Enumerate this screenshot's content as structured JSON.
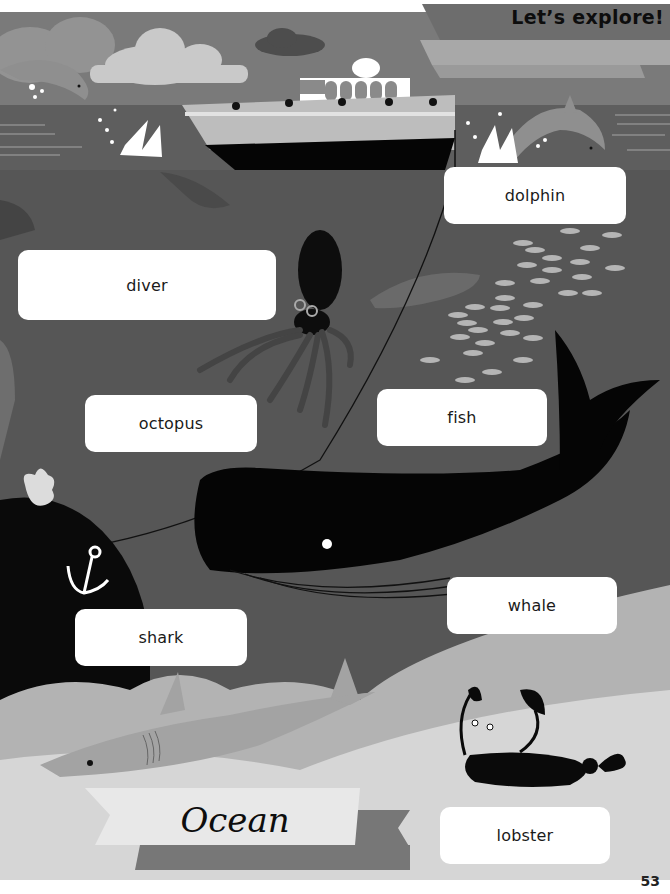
{
  "header": {
    "title": "Let’s explore!"
  },
  "scene": {
    "colors": {
      "sky": "#7a7a7a",
      "sea_surface": "#5e5e5e",
      "deep_sea": "#565656",
      "sand_light": "#d6d6d6",
      "sand_mid": "#b3b3b3",
      "whale": "#050505",
      "label_bg": "#ffffff"
    }
  },
  "labels": [
    {
      "id": "dolphin",
      "text": "dolphin"
    },
    {
      "id": "diver",
      "text": "diver"
    },
    {
      "id": "octopus",
      "text": "octopus"
    },
    {
      "id": "fish",
      "text": "fish"
    },
    {
      "id": "whale",
      "text": "whale"
    },
    {
      "id": "shark",
      "text": "shark"
    },
    {
      "id": "lobster",
      "text": "lobster"
    }
  ],
  "banner": {
    "title": "Ocean"
  },
  "footer": {
    "page_number": "53"
  }
}
